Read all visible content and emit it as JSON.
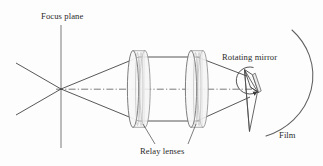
{
  "figure": {
    "kind": "optical-ray-diagram",
    "title_visible": false,
    "background_color": "#fdfdfd",
    "line_color": "#3a3a3a",
    "lens_fill_color": "#f2f2f2",
    "text_color": "#2a2a2a"
  },
  "labels": {
    "focus_plane": "Focus plane",
    "rotating_mirror": "Rotating mirror",
    "relay_lenses": "Relay lenses",
    "film": "Film"
  },
  "components": {
    "focus_plane_line": {
      "name": "Focus plane",
      "orientation": "vertical",
      "x": 61,
      "y_top": 25,
      "y_bottom": 148
    },
    "focus_point": {
      "name": "Focus point",
      "x": 61,
      "y": 89
    },
    "optical_axis": {
      "name": "Optical axis",
      "style": "dash-dot",
      "x_start": 61,
      "x_end": 250,
      "y": 89
    },
    "lens_1": {
      "name": "Relay lens 1",
      "x": 139,
      "y": 89,
      "semi_height": 39,
      "semi_width": 6
    },
    "lens_2": {
      "name": "Relay lens 2",
      "x": 197,
      "y": 89,
      "semi_height": 39,
      "semi_width": 6
    },
    "rotating_mirror": {
      "name": "Rotating mirror",
      "x": 250,
      "y": 89,
      "rotation_arrow": "clockwise"
    },
    "film": {
      "name": "Film",
      "shape": "arc",
      "center_x": 232,
      "center_y": 90,
      "radius": 68
    }
  },
  "rays": {
    "description": "Rays diverge from the focus point, are collimated by relay lens 1, travel parallel between the lenses, and are converged by relay lens 2 onto the rotating mirror, which reflects them onto the film arc.",
    "upper_marginal_y_at_lens": 57,
    "lower_marginal_y_at_lens": 121,
    "count": 2
  },
  "leaders": {
    "relay_lens_1_leader": {
      "from_x": 153,
      "from_y": 144,
      "to_x": 142,
      "to_y": 124
    },
    "relay_lens_2_leader": {
      "from_x": 190,
      "from_y": 144,
      "to_x": 199,
      "to_y": 124
    }
  }
}
